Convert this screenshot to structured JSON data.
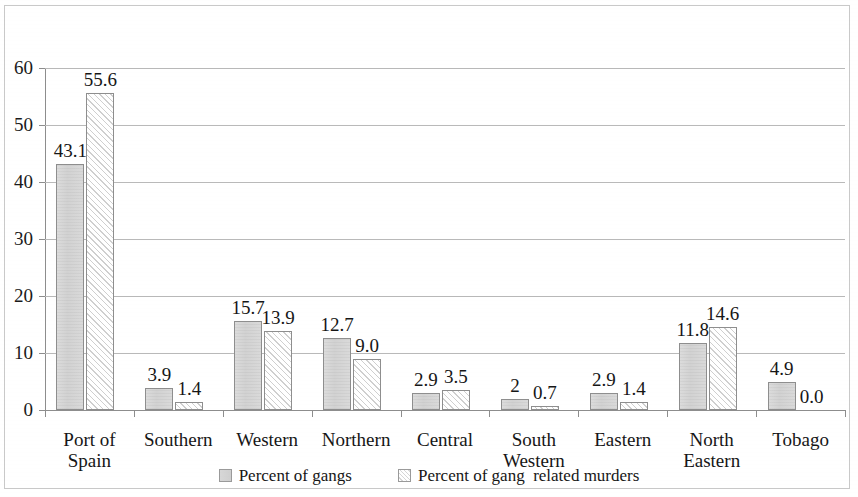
{
  "chart_data": {
    "type": "bar",
    "title": "",
    "xlabel": "",
    "ylabel": "",
    "ylim": [
      0,
      60
    ],
    "yticks": [
      0,
      10,
      20,
      30,
      40,
      50,
      60
    ],
    "ytick_labels": [
      "0",
      "10",
      "20",
      "30",
      "40",
      "50",
      "60"
    ],
    "grid": true,
    "legend_position": "bottom",
    "categories": [
      "Port of Spain",
      "Southern",
      "Western",
      "Northern",
      "Central",
      "South Western",
      "Eastern",
      "North Eastern",
      "Tobago"
    ],
    "category_lines": [
      [
        "Port of",
        "Spain"
      ],
      [
        "Southern",
        ""
      ],
      [
        "Western",
        ""
      ],
      [
        "Northern",
        ""
      ],
      [
        "Central",
        ""
      ],
      [
        "South",
        "Western"
      ],
      [
        "Eastern",
        ""
      ],
      [
        "North",
        "Eastern"
      ],
      [
        "Tobago",
        ""
      ]
    ],
    "series": [
      {
        "name": "Percent of gangs",
        "values": [
          43.1,
          3.9,
          15.7,
          12.7,
          2.9,
          2.0,
          2.9,
          11.8,
          4.9
        ],
        "labels": [
          "43.1",
          "3.9",
          "15.7",
          "12.7",
          "2.9",
          "2",
          "2.9",
          "11.8",
          "4.9"
        ],
        "color": "#d4d4d4",
        "fill": "solid-gray"
      },
      {
        "name": "Percent of gang  related murders",
        "values": [
          55.6,
          1.4,
          13.9,
          9.0,
          3.5,
          0.7,
          1.4,
          14.6,
          0.0
        ],
        "labels": [
          "55.6",
          "1.4",
          "13.9",
          "9.0",
          "3.5",
          "0.7",
          "1.4",
          "14.6",
          "0.0"
        ],
        "color": "#ffffff",
        "fill": "diagonal-hatch"
      }
    ]
  },
  "legend": {
    "items": [
      {
        "label": "Percent of gangs",
        "swatch": "series-gangs"
      },
      {
        "label": "Percent of gang  related murders",
        "swatch": "series-murders"
      }
    ]
  },
  "colors": {
    "axis": "#8d8d8d",
    "gridline": "#b9b9b9",
    "text": "#161616",
    "series_gangs": "#d4d4d4",
    "series_murders": "#ffffff",
    "frame": "#c9c9c9"
  }
}
